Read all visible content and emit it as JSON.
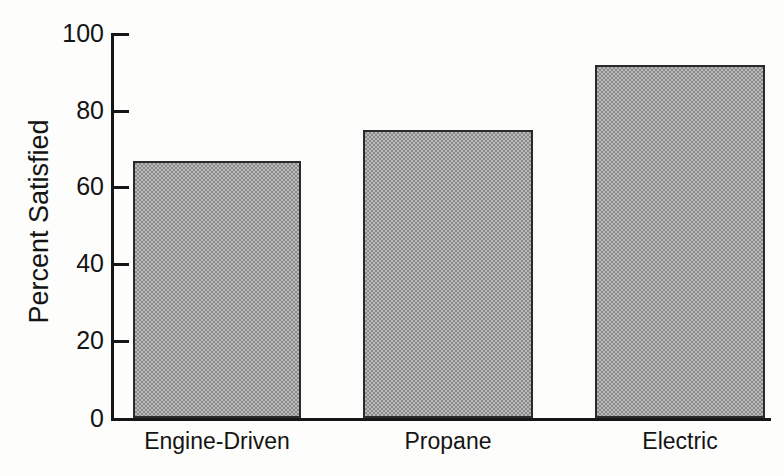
{
  "chart_data": {
    "type": "bar",
    "title": "",
    "subtitle": "",
    "xlabel": "",
    "ylabel": "Percent Satisfied",
    "categories": [
      "Engine-Driven",
      "Propane",
      "Electric"
    ],
    "values": [
      66.7,
      74.7,
      91.7
    ],
    "series": [
      {
        "name": "Percent Satisfied",
        "values": [
          66.7,
          74.7,
          91.7
        ]
      }
    ],
    "ylim": [
      0,
      100
    ],
    "ytick_labels": [
      "0",
      "20",
      "40",
      "60",
      "80",
      "100"
    ],
    "ytick_values": [
      0,
      20,
      40,
      60,
      80,
      100
    ],
    "grid": false,
    "legend": false,
    "legend_position": "none",
    "bar_fill_color": "#8b8b8b",
    "bar_edge_color": "#2a2a2a",
    "axis_color": "#161616",
    "background_color": "#fdfdfb",
    "annotations": []
  },
  "axes": {
    "y_axis_title": "Percent Satisfied",
    "ticks": [
      {
        "label": "100",
        "value": 100
      },
      {
        "label": "80",
        "value": 80
      },
      {
        "label": "60",
        "value": 60
      },
      {
        "label": "40",
        "value": 40
      },
      {
        "label": "20",
        "value": 20
      },
      {
        "label": "0",
        "value": 0
      }
    ]
  },
  "bars": [
    {
      "label": "Engine-Driven",
      "value": 66.7
    },
    {
      "label": "Propane",
      "value": 74.7
    },
    {
      "label": "Electric",
      "value": 91.7
    }
  ]
}
